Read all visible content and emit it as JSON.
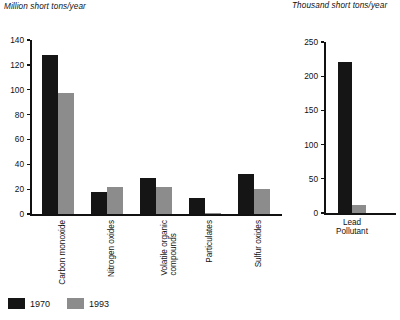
{
  "chart_data": [
    {
      "type": "bar",
      "id": "main-emissions",
      "title": "Million short tons/year",
      "xlabel": "",
      "ylabel": "Million short tons/year",
      "ylim": [
        0,
        140
      ],
      "yticks": [
        0,
        20,
        40,
        60,
        80,
        100,
        120,
        140
      ],
      "ytick_labels": [
        "0",
        "20",
        "40",
        "60",
        "80",
        "100",
        "120",
        "140"
      ],
      "grid": false,
      "legend_position": "bottom-left",
      "categories": [
        "Carbon monoxide",
        "Nitrogen oxides",
        "Volatile organic\ncompounds",
        "Particulates",
        "Sulfur oxides"
      ],
      "series": [
        {
          "name": "1970",
          "color": "#151515",
          "values": [
            128,
            18,
            29,
            13,
            32
          ]
        },
        {
          "name": "1993",
          "color": "#8c8c8c",
          "values": [
            97,
            22,
            22,
            0.5,
            20
          ]
        }
      ]
    },
    {
      "type": "bar",
      "id": "lead-emissions",
      "title": "Thousand short tons/year",
      "xlabel": "Pollutant",
      "ylabel": "Thousand short tons/year",
      "ylim": [
        0,
        250
      ],
      "yticks": [
        0,
        50,
        100,
        150,
        200,
        250
      ],
      "ytick_labels": [
        "0",
        "50",
        "100",
        "150",
        "200",
        "250"
      ],
      "grid": false,
      "legend_position": "shared",
      "categories": [
        "Lead"
      ],
      "series": [
        {
          "name": "1970",
          "color": "#151515",
          "values": [
            221
          ]
        },
        {
          "name": "1993",
          "color": "#8c8c8c",
          "values": [
            12
          ]
        }
      ]
    }
  ],
  "legend": {
    "items": [
      {
        "label": "1970",
        "color": "#151515"
      },
      {
        "label": "1993",
        "color": "#8c8c8c"
      }
    ]
  },
  "axis_titles": {
    "left": "Million short tons/year",
    "right": "Thousand short tons/year"
  },
  "right_chart_xaxis": {
    "category": "Lead",
    "axis_name": "Pollutant"
  },
  "colors": {
    "series_1970": "#151515",
    "series_1993": "#8c8c8c",
    "axis": "#111111",
    "background": "#ffffff"
  }
}
